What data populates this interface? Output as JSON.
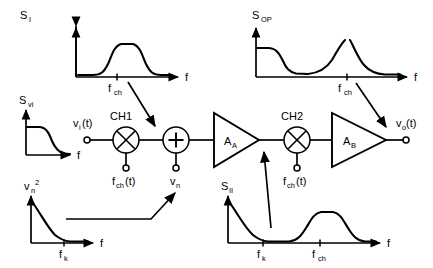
{
  "diagram": {
    "ink_color": "#000000",
    "background": "#ffffff"
  },
  "blocks": [
    {
      "id": "ch1",
      "label": "CH1",
      "type": "mixer",
      "symbol": "x"
    },
    {
      "id": "sum",
      "label": "",
      "type": "summer",
      "symbol": "+"
    },
    {
      "id": "ampA",
      "label": "A",
      "sub": "A",
      "type": "amplifier"
    },
    {
      "id": "ch2",
      "label": "CH2",
      "type": "mixer",
      "symbol": "x"
    },
    {
      "id": "ampB",
      "label": "A",
      "sub": "B",
      "type": "amplifier"
    }
  ],
  "terminals": [
    {
      "id": "vi",
      "label": "v",
      "sub": "i",
      "suffix": "(t)"
    },
    {
      "id": "fch1",
      "label": "f",
      "sub": "ch",
      "suffix": "(t)"
    },
    {
      "id": "vn",
      "label": "v",
      "sub": "n",
      "suffix": ""
    },
    {
      "id": "fch2",
      "label": "f",
      "sub": "ch",
      "suffix": "(t)"
    },
    {
      "id": "vo",
      "label": "v",
      "sub": "o",
      "suffix": "(t)"
    }
  ],
  "plots": {
    "s_i": {
      "name": "S_I",
      "ylabel": "S",
      "ylabel_sub": "I",
      "xlabel": "f",
      "ticks": [
        {
          "label": "f",
          "sub": "ch"
        }
      ],
      "shape": "band-pass plateau centered at f_ch"
    },
    "s_op": {
      "name": "S_OP",
      "ylabel": "S",
      "ylabel_sub": "OP",
      "xlabel": "f",
      "ticks": [
        {
          "label": "f",
          "sub": "ch"
        }
      ],
      "shape": "low-frequency shelf then floor then sharp peak at f_ch"
    },
    "s_vi": {
      "name": "S_vi",
      "ylabel": "S",
      "ylabel_sub": "vi",
      "xlabel": "f",
      "ticks": [],
      "shape": "low-pass roll-off"
    },
    "vn2": {
      "name": "vn^2",
      "ylabel": "v",
      "ylabel_sub": "n",
      "ylabel_sup": "2",
      "xlabel": "f",
      "ticks": [
        {
          "label": "f",
          "sub": "k"
        }
      ],
      "shape": "1/f noise decaying to flat thermal floor"
    },
    "s_ii": {
      "name": "S_II",
      "ylabel": "S",
      "ylabel_sub": "II",
      "xlabel": "f",
      "ticks": [
        {
          "label": "f",
          "sub": "k"
        },
        {
          "label": "f",
          "sub": "ch"
        }
      ],
      "shape": "1/f noise to floor at f_k plus signal band centered at f_ch"
    }
  },
  "annotations": [
    {
      "id": "ann-si-to-sum",
      "from": "s_i plot",
      "to": "summer node"
    },
    {
      "id": "ann-sop-to-vo",
      "from": "s_op plot",
      "to": "output v_o"
    },
    {
      "id": "ann-vn2-to-vn",
      "from": "vn2 plot",
      "to": "v_n terminal"
    },
    {
      "id": "ann-sii-to-ampA",
      "from": "s_ii plot",
      "to": "A_A output node"
    }
  ]
}
